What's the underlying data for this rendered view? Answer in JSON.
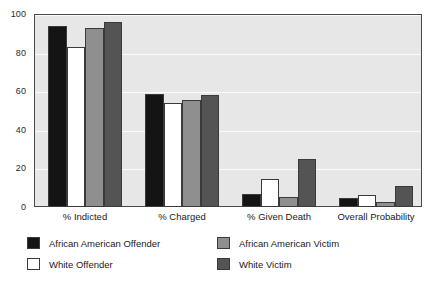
{
  "chart_data": {
    "type": "bar",
    "title": "",
    "subtitle": "",
    "xlabel": "",
    "ylabel": "",
    "ylim": [
      0,
      100
    ],
    "yticks": [
      0,
      20,
      40,
      60,
      80,
      100
    ],
    "ytick_labels": [
      "0",
      "20",
      "40",
      "60",
      "80",
      "100"
    ],
    "grid": true,
    "legend_position": "bottom",
    "categories": [
      "% Indicted",
      "% Charged",
      "% Given Death",
      "Overall Probability"
    ],
    "series": [
      {
        "name": "African American Offender",
        "color": "#141414",
        "values": [
          94,
          58.5,
          7,
          4.5
        ]
      },
      {
        "name": "White Offender",
        "color": "#ffffff",
        "values": [
          83,
          54,
          14.5,
          6
        ]
      },
      {
        "name": "African American Victim",
        "color": "#8f8f8f",
        "values": [
          93,
          55.5,
          5,
          2.5
        ]
      },
      {
        "name": "White Victim",
        "color": "#545454",
        "values": [
          96,
          58,
          25,
          11
        ]
      }
    ]
  },
  "style": {
    "plot_background": "#e7e7e7",
    "gridline_color": "#fbfbfb",
    "axis_color": "#4a4a4a",
    "page_background": "#ffffff"
  }
}
